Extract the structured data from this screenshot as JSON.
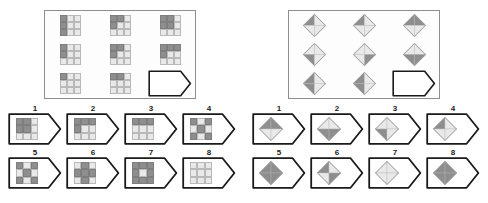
{
  "page": {
    "background_color": "#ffffff",
    "dark_fill": "#8e8e8e",
    "light_fill": "#e9e9e9",
    "mid_fill": "#cfcfcf",
    "outline_color": "#1a1a1a",
    "frame_color": "#8e8e8e"
  },
  "puzzles": [
    {
      "id": "puzzle-left",
      "figure_type": "3x3-square-grid",
      "matrix": {
        "rows": 3,
        "cols": 3,
        "cells": [
          {
            "index": 1,
            "kind": "figure",
            "fills": [
              "d",
              "l",
              "l",
              "d",
              "l",
              "l",
              "d",
              "l",
              "l"
            ],
            "desc": "left column dark"
          },
          {
            "index": 2,
            "kind": "figure",
            "fills": [
              "d",
              "d",
              "l",
              "d",
              "l",
              "l",
              "l",
              "l",
              "l"
            ],
            "desc": "top-left L dark"
          },
          {
            "index": 3,
            "kind": "figure",
            "fills": [
              "d",
              "d",
              "l",
              "d",
              "d",
              "l",
              "l",
              "l",
              "l"
            ],
            "desc": "top-left 2x2 dark"
          },
          {
            "index": 4,
            "kind": "figure",
            "fills": [
              "d",
              "l",
              "l",
              "d",
              "l",
              "l",
              "l",
              "l",
              "l"
            ],
            "desc": "left column upper dark"
          },
          {
            "index": 5,
            "kind": "figure",
            "fills": [
              "d",
              "d",
              "l",
              "d",
              "l",
              "l",
              "l",
              "l",
              "l"
            ],
            "desc": "top-left step dark"
          },
          {
            "index": 6,
            "kind": "figure",
            "fills": [
              "d",
              "d",
              "d",
              "d",
              "l",
              "l",
              "l",
              "l",
              "l"
            ],
            "desc": "top row dark"
          },
          {
            "index": 7,
            "kind": "figure",
            "fills": [
              "d",
              "l",
              "l",
              "l",
              "l",
              "l",
              "l",
              "l",
              "l"
            ],
            "desc": "top-left single dark"
          },
          {
            "index": 8,
            "kind": "figure",
            "fills": [
              "d",
              "d",
              "l",
              "l",
              "l",
              "l",
              "l",
              "l",
              "l"
            ],
            "desc": "top-left pair dark"
          },
          {
            "index": 9,
            "kind": "blank",
            "desc": "missing piece"
          }
        ]
      },
      "options": [
        {
          "number": "1",
          "fills": [
            "d",
            "d",
            "l",
            "d",
            "d",
            "l",
            "l",
            "l",
            "l"
          ],
          "desc": "top-left 2x2 dark"
        },
        {
          "number": "2",
          "fills": [
            "d",
            "d",
            "d",
            "d",
            "l",
            "l",
            "l",
            "l",
            "l"
          ],
          "desc": "top row plus left dark"
        },
        {
          "number": "3",
          "fills": [
            "d",
            "d",
            "d",
            "l",
            "l",
            "l",
            "l",
            "l",
            "l"
          ],
          "desc": "top row dark"
        },
        {
          "number": "4",
          "fills": [
            "d",
            "l",
            "d",
            "l",
            "d",
            "l",
            "d",
            "l",
            "d"
          ],
          "desc": "X diagonal dark"
        },
        {
          "number": "5",
          "fills": [
            "d",
            "l",
            "d",
            "l",
            "d",
            "l",
            "d",
            "l",
            "d"
          ],
          "desc": "checker X dark"
        },
        {
          "number": "6",
          "fills": [
            "l",
            "d",
            "l",
            "d",
            "d",
            "d",
            "l",
            "d",
            "l"
          ],
          "desc": "plus dark"
        },
        {
          "number": "7",
          "fills": [
            "d",
            "d",
            "d",
            "d",
            "l",
            "d",
            "d",
            "d",
            "d"
          ],
          "desc": "ring dark, centre light"
        },
        {
          "number": "8",
          "fills": [
            "l",
            "l",
            "l",
            "l",
            "l",
            "l",
            "l",
            "l",
            "l"
          ],
          "desc": "all light"
        }
      ]
    },
    {
      "id": "puzzle-right",
      "figure_type": "quadrant-diamond",
      "matrix": {
        "rows": 3,
        "cols": 3,
        "cells": [
          {
            "index": 1,
            "kind": "figure",
            "quads": [
              "d",
              "l",
              "l",
              "l"
            ],
            "desc": "top-left quadrant dark"
          },
          {
            "index": 2,
            "kind": "figure",
            "quads": [
              "d",
              "l",
              "l",
              "l"
            ],
            "desc": "top-left quadrant dark"
          },
          {
            "index": 3,
            "kind": "figure",
            "quads": [
              "d",
              "d",
              "l",
              "l"
            ],
            "desc": "top half dark"
          },
          {
            "index": 4,
            "kind": "figure",
            "quads": [
              "l",
              "l",
              "d",
              "l"
            ],
            "desc": "bottom-left quadrant dark"
          },
          {
            "index": 5,
            "kind": "figure",
            "quads": [
              "l",
              "l",
              "l",
              "d"
            ],
            "desc": "bottom-right quadrant dark"
          },
          {
            "index": 6,
            "kind": "figure",
            "quads": [
              "l",
              "l",
              "d",
              "d"
            ],
            "desc": "bottom half dark"
          },
          {
            "index": 7,
            "kind": "figure",
            "quads": [
              "d",
              "l",
              "d",
              "l"
            ],
            "desc": "left half dark"
          },
          {
            "index": 8,
            "kind": "figure",
            "quads": [
              "d",
              "l",
              "d",
              "l"
            ],
            "desc": "left half dark"
          },
          {
            "index": 9,
            "kind": "blank",
            "desc": "missing piece"
          }
        ]
      },
      "options": [
        {
          "number": "1",
          "quads": [
            "d",
            "d",
            "l",
            "l"
          ],
          "desc": "top half dark"
        },
        {
          "number": "2",
          "quads": [
            "l",
            "l",
            "d",
            "d"
          ],
          "desc": "bottom half dark"
        },
        {
          "number": "3",
          "quads": [
            "l",
            "l",
            "d",
            "l"
          ],
          "desc": "bottom-left quadrant dark"
        },
        {
          "number": "4",
          "quads": [
            "d",
            "l",
            "l",
            "l"
          ],
          "desc": "top-left quadrant dark"
        },
        {
          "number": "5",
          "quads": [
            "d",
            "d",
            "d",
            "d"
          ],
          "desc": "all dark with light cross"
        },
        {
          "number": "6",
          "quads": [
            "d",
            "l",
            "l",
            "d"
          ],
          "desc": "opposite quadrants dark"
        },
        {
          "number": "7",
          "quads": [
            "l",
            "l",
            "l",
            "l"
          ],
          "desc": "all light"
        },
        {
          "number": "8",
          "quads": [
            "d",
            "d",
            "d",
            "d"
          ],
          "desc": "all dark"
        }
      ]
    }
  ]
}
